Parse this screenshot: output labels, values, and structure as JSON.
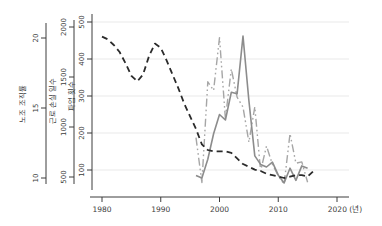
{
  "chart_data": {
    "type": "line",
    "title": "",
    "background": "#ffffff",
    "grid": true,
    "grid_color": "#e3e3e3",
    "axis_color": "#3c3c3c",
    "legend_position": "none",
    "x_axis": {
      "tick_years": [
        1980,
        1990,
        2000,
        2010,
        2020
      ],
      "tick_labels": [
        "1980",
        "1990",
        "2000",
        "2010",
        "2020"
      ],
      "unit_suffix": "(년)",
      "range": [
        1978,
        2022
      ]
    },
    "y_axes": [
      {
        "id": "density",
        "title": "노조 조직률",
        "ticks": [
          10,
          15,
          20
        ],
        "range": [
          9.5,
          21.0
        ]
      },
      {
        "id": "lost_days",
        "title": "근로 손실 일수",
        "ticks": [
          500,
          1000,
          1500,
          2000
        ],
        "range": [
          350,
          2100
        ]
      },
      {
        "id": "strikes",
        "title": "파업 횟수",
        "ticks": [
          100,
          200,
          300,
          400,
          500
        ],
        "range": [
          60,
          530
        ]
      }
    ],
    "series": [
      {
        "name": "노조 조직률",
        "axis": "density",
        "line_style": "dashed",
        "color": "#2b2b2b",
        "start_year": 1980,
        "values": [
          20.1,
          19.9,
          19.5,
          19.0,
          18.2,
          17.3,
          16.9,
          17.4,
          18.7,
          19.6,
          19.3,
          18.4,
          17.4,
          16.4,
          15.3,
          14.4,
          13.5,
          12.4,
          12.0,
          11.9,
          11.9,
          11.9,
          11.8,
          11.4,
          11.0,
          10.8,
          10.6,
          10.5,
          10.3,
          10.2,
          10.1,
          10.0,
          10.1,
          10.2,
          10.2,
          10.1,
          10.5
        ]
      },
      {
        "name": "근로 손실 일수",
        "axis": "lost_days",
        "line_style": "dashdot",
        "color": "#a6a6a6",
        "start_year": 1996,
        "values": [
          893,
          445,
          1452,
          1366,
          1894,
          1083,
          1580,
          1299,
          1199,
          848,
          1201,
          560,
          809,
          627,
          511,
          429,
          933,
          638,
          651,
          447
        ]
      },
      {
        "name": "파업 횟수",
        "axis": "strikes",
        "line_style": "solid",
        "color": "#8c8c8c",
        "start_year": 1996,
        "values": [
          85,
          78,
          129,
          198,
          250,
          235,
          310,
          306,
          462,
          287,
          138,
          115,
          108,
          121,
          86,
          65,
          105,
          72,
          111,
          105
        ]
      }
    ]
  }
}
